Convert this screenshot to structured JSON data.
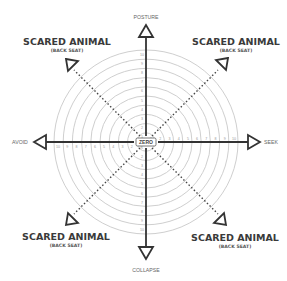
{
  "diagram": {
    "type": "radial-compass",
    "center": {
      "x": 146,
      "y": 142
    },
    "ring_count": 10,
    "outer_radius": 92,
    "colors": {
      "axis": "#333333",
      "rings": "#cfcfcf",
      "dotted": "#444444",
      "text_dark": "#3a3a3a",
      "text_light": "#9a9a9a"
    },
    "axes": {
      "top": {
        "label": "POSTURE"
      },
      "bottom": {
        "label": "COLLAPSE"
      },
      "left": {
        "label": "AVOID"
      },
      "right": {
        "label": "SEEK"
      }
    },
    "center_label": "ZERO",
    "ticks": [
      "1",
      "2",
      "3",
      "4",
      "5",
      "6",
      "7",
      "8",
      "9",
      "10"
    ],
    "corners": {
      "top_left": {
        "title": "SCARED ANIMAL",
        "subtitle": "(BACK SEAT)"
      },
      "top_right": {
        "title": "SCARED ANIMAL",
        "subtitle": "(BACK SEAT)"
      },
      "bottom_left": {
        "title": "SCARED ANIMAL",
        "subtitle": "(BACK SEAT)"
      },
      "bottom_right": {
        "title": "SCARED ANIMAL",
        "subtitle": "(BACK SEAT)"
      }
    }
  }
}
